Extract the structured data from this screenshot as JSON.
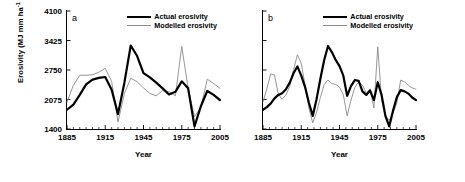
{
  "chart_data": [
    {
      "type": "line",
      "panel": "a",
      "title": "",
      "xlabel": "Year",
      "ylabel": "Erosivity (MJ mm ha-1 h-1 y-1)",
      "xlim": [
        1885,
        2005
      ],
      "ylim": [
        1400,
        4100
      ],
      "yticks": [
        1400,
        2075,
        2750,
        3425,
        4100
      ],
      "xticks": [
        1885,
        1915,
        1945,
        1975,
        2005
      ],
      "grid": false,
      "legend_position": "top-right",
      "x": [
        1885,
        1890,
        1895,
        1900,
        1905,
        1910,
        1915,
        1920,
        1925,
        1930,
        1935,
        1940,
        1945,
        1950,
        1955,
        1960,
        1965,
        1970,
        1975,
        1980,
        1985,
        1990,
        1995,
        2000,
        2005
      ],
      "series": [
        {
          "name": "Actual erosivity",
          "color": "#000000",
          "values": [
            1840,
            1960,
            2180,
            2420,
            2530,
            2570,
            2590,
            2300,
            1740,
            2460,
            3310,
            3070,
            2680,
            2580,
            2460,
            2330,
            2190,
            2250,
            2490,
            2330,
            1460,
            1920,
            2270,
            2180,
            2060
          ]
        },
        {
          "name": "Modelled erosivity",
          "color": "#8a8a8a",
          "values": [
            2020,
            2400,
            2630,
            2630,
            2640,
            2700,
            2790,
            2490,
            1560,
            2210,
            2560,
            2480,
            2340,
            2210,
            2160,
            2280,
            2250,
            2160,
            3290,
            2330,
            1680,
            1900,
            2540,
            2440,
            2330
          ]
        }
      ]
    },
    {
      "type": "line",
      "panel": "b",
      "title": "",
      "xlabel": "Year",
      "ylabel": "Erosivity (MJ mm ha-1 h-1 y-1)",
      "xlim": [
        1885,
        2005
      ],
      "ylim": [
        1400,
        4100
      ],
      "yticks": [
        1400,
        2075,
        2750,
        3425,
        4100
      ],
      "xticks": [
        1885,
        1915,
        1945,
        1975,
        2005
      ],
      "grid": false,
      "legend_position": "top-right",
      "x": [
        1885,
        1888,
        1891,
        1894,
        1897,
        1900,
        1903,
        1906,
        1909,
        1912,
        1915,
        1918,
        1921,
        1924,
        1927,
        1930,
        1933,
        1936,
        1939,
        1942,
        1945,
        1948,
        1951,
        1954,
        1957,
        1960,
        1963,
        1966,
        1969,
        1972,
        1975,
        1978,
        1981,
        1984,
        1987,
        1990,
        1993,
        1996,
        1999,
        2002,
        2005
      ],
      "series": [
        {
          "name": "Actual erosivity",
          "color": "#000000",
          "values": [
            1840,
            1900,
            1980,
            2100,
            2180,
            2220,
            2310,
            2460,
            2680,
            2830,
            2620,
            2360,
            2000,
            1700,
            2080,
            2550,
            2980,
            3300,
            3160,
            2980,
            2840,
            2620,
            2160,
            2380,
            2520,
            2500,
            2260,
            2180,
            2280,
            2060,
            2470,
            2180,
            1700,
            1460,
            1820,
            2130,
            2290,
            2260,
            2210,
            2120,
            2060
          ]
        },
        {
          "name": "Modelled erosivity",
          "color": "#8a8a8a",
          "values": [
            2020,
            2320,
            2660,
            2640,
            2200,
            2080,
            2180,
            2380,
            2760,
            3100,
            2900,
            2400,
            1880,
            1540,
            1780,
            2120,
            2420,
            2520,
            2440,
            2420,
            2360,
            2180,
            1700,
            2060,
            2350,
            2480,
            2400,
            2230,
            2320,
            1880,
            3280,
            2060,
            1700,
            1600,
            1760,
            2000,
            2520,
            2480,
            2400,
            2340,
            2310
          ]
        }
      ]
    }
  ],
  "ylabel": {
    "prefix": "Erosivity (MJ mm ha",
    "e1": "-1",
    "mid1": " h",
    "e2": "-1",
    "mid2": " y",
    "e3": "-1",
    "suffix": ")"
  },
  "panels": [
    {
      "letter": "a",
      "xlabel": "Year",
      "legend": [
        {
          "label": "Actual erosivity",
          "style": "actual"
        },
        {
          "label": "Modelled erosivity",
          "style": "model"
        }
      ]
    },
    {
      "letter": "b",
      "xlabel": "Year",
      "legend": [
        {
          "label": "Actual erosivity",
          "style": "actual"
        },
        {
          "label": "Modelled erosivity",
          "style": "model"
        }
      ]
    }
  ],
  "colors": {
    "actual": "#000000",
    "modelled": "#8a8a8a",
    "axis": "#000000",
    "background": "#ffffff"
  }
}
